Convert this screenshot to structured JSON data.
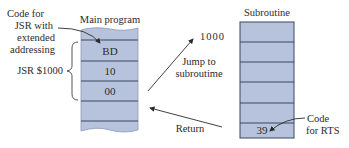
{
  "main_program": {
    "title": "Main program",
    "cells": [
      "",
      "BD",
      "10",
      "00",
      "",
      ""
    ],
    "fill_color": "#b7c3dc",
    "line_color": "#3c4660"
  },
  "subroutine": {
    "title": "Subroutine",
    "cells": [
      "",
      "",
      "",
      "",
      "",
      "39"
    ],
    "fill_color": "#b7c3dc",
    "line_color": "#3c4660"
  },
  "annotations": {
    "code_for_jsr": [
      "Code for",
      "JSR with",
      "extended",
      "addressing"
    ],
    "jsr_instruction": "JSR $1000",
    "address_label": "1000",
    "jump_label": [
      "Jump to",
      "subroutime"
    ],
    "return_label": "Return",
    "code_for_rts": [
      "Code",
      "for RTS"
    ]
  }
}
